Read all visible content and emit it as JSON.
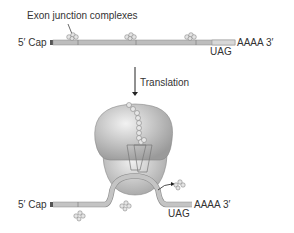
{
  "top": {
    "ejc_label": "Exon junction complexes",
    "cap_label": "5′ Cap",
    "tail_label": "AAAA  3′",
    "stop_codon": "UAG"
  },
  "arrow": {
    "label": "Translation"
  },
  "bottom": {
    "cap_label": "5′ Cap",
    "tail_label": "AAAA  3′",
    "stop_codon": "UAG"
  },
  "colors": {
    "mrna": "#b8b8b8",
    "ribosome": "#c8c8c8",
    "ejc": "#d8d8d8"
  }
}
